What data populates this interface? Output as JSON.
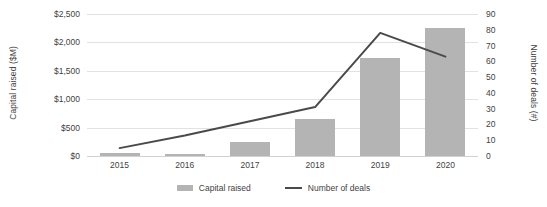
{
  "chart_data": {
    "type": "bar",
    "title": "",
    "subtitle": "",
    "xlabel": "",
    "ylabel": "Capital raised ($M)",
    "y2label": "Number of deals (#)",
    "categories": [
      "2015",
      "2016",
      "2017",
      "2018",
      "2019",
      "2020"
    ],
    "ylim": [
      0,
      2500
    ],
    "y2lim": [
      0,
      90
    ],
    "yticks": [
      "$0",
      "$500",
      "$1,000",
      "$1,500",
      "$2,000",
      "$2,500"
    ],
    "ytick_values": [
      0,
      500,
      1000,
      1500,
      2000,
      2500
    ],
    "y2ticks": [
      "0",
      "10",
      "20",
      "30",
      "40",
      "50",
      "60",
      "70",
      "80",
      "90"
    ],
    "y2tick_values": [
      0,
      10,
      20,
      30,
      40,
      50,
      60,
      70,
      80,
      90
    ],
    "grid": true,
    "legend_position": "bottom",
    "series": [
      {
        "name": "Capital raised",
        "type": "bar",
        "axis": "left",
        "unit": "$M",
        "color": "#b4b4b4",
        "values": [
          55,
          35,
          250,
          650,
          1720,
          2250
        ]
      },
      {
        "name": "Number of deals",
        "type": "line",
        "axis": "right",
        "unit": "#",
        "color": "#4a4a4a",
        "values": [
          5,
          13,
          22,
          31,
          78,
          63
        ]
      }
    ]
  },
  "legend": {
    "items": [
      {
        "label": "Capital raised",
        "marker": "bar-swatch"
      },
      {
        "label": "Number of deals",
        "marker": "line-swatch"
      }
    ]
  }
}
